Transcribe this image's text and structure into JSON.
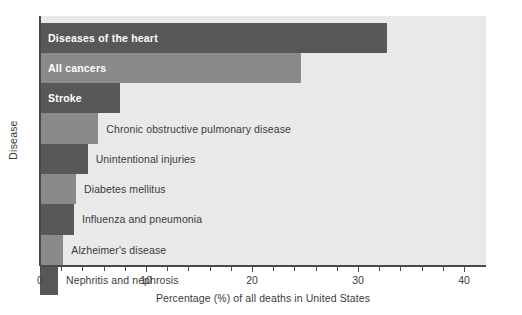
{
  "chart_data": {
    "type": "bar",
    "orientation": "horizontal",
    "title": "",
    "xlabel": "Percentage (%) of all deaths in United States",
    "ylabel": "Disease",
    "xlim": [
      0,
      40
    ],
    "grid": false,
    "legend": "none",
    "x_tick_labels": [
      "0",
      "10",
      "20",
      "30",
      "40"
    ],
    "x_tick_values": [
      0,
      10,
      20,
      30,
      40
    ],
    "x_minor_tick_step": 2,
    "categories": [
      "Diseases of the heart",
      "All cancers",
      "Stroke",
      "Chronic obstructive pulmonary disease",
      "Unintentional injuries",
      "Diabetes mellitus",
      "Influenza and pneumonia",
      "Alzheimer's disease",
      "Nephritis and nephrosis"
    ],
    "values": [
      32.7,
      24.6,
      7.5,
      5.5,
      4.5,
      3.4,
      3.2,
      2.2,
      1.7
    ],
    "bars": [
      {
        "label": "Diseases of the heart",
        "value": 32.7,
        "color": "#585858",
        "label_position": "inside"
      },
      {
        "label": "All cancers",
        "value": 24.6,
        "color": "#8a8a8a",
        "label_position": "inside"
      },
      {
        "label": "Stroke",
        "value": 7.5,
        "color": "#585858",
        "label_position": "inside"
      },
      {
        "label": "Chronic obstructive pulmonary disease",
        "value": 5.5,
        "color": "#8a8a8a",
        "label_position": "outside"
      },
      {
        "label": "Unintentional injuries",
        "value": 4.5,
        "color": "#585858",
        "label_position": "outside"
      },
      {
        "label": "Diabetes mellitus",
        "value": 3.4,
        "color": "#8a8a8a",
        "label_position": "outside"
      },
      {
        "label": "Influenza and pneumonia",
        "value": 3.2,
        "color": "#585858",
        "label_position": "outside"
      },
      {
        "label": "Alzheimer's disease",
        "value": 2.2,
        "color": "#8a8a8a",
        "label_position": "outside"
      },
      {
        "label": "Nephritis and nephrosis",
        "value": 1.7,
        "color": "#585858",
        "label_position": "outside"
      }
    ],
    "colors": {
      "plot_background": "#e9e9e9",
      "page_background": "#ffffff",
      "bar_dark": "#585858",
      "bar_light": "#8a8a8a",
      "axis": "#4a4a4a",
      "text": "#3b3b3b",
      "inside_label_text": "#ffffff"
    }
  }
}
